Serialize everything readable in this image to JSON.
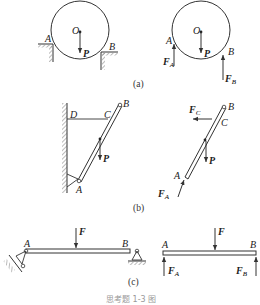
{
  "figure": {
    "caption": "思考题 1-3 图",
    "panels": [
      {
        "id": "a",
        "label": "(a)",
        "left": {
          "center": "O",
          "points": [
            "A",
            "B"
          ],
          "load": "P"
        },
        "right": {
          "center": "O",
          "points": [
            "A",
            "B"
          ],
          "load": "P",
          "reactions": [
            "F",
            "F"
          ],
          "reaction_subs": [
            "A",
            "B"
          ]
        }
      },
      {
        "id": "b",
        "label": "(b)",
        "left": {
          "points": [
            "D",
            "C",
            "B",
            "A"
          ],
          "load": "P"
        },
        "right": {
          "points": [
            "B",
            "C",
            "A"
          ],
          "load": "P",
          "reactions": [
            "F",
            "F"
          ],
          "reaction_subs": [
            "C",
            "A"
          ]
        }
      },
      {
        "id": "c",
        "label": "(c)",
        "left": {
          "points": [
            "A",
            "B"
          ],
          "load": "F"
        },
        "right": {
          "points": [
            "A",
            "B"
          ],
          "load": "F",
          "reactions": [
            "F",
            "F"
          ],
          "reaction_subs": [
            "A",
            "B"
          ]
        }
      }
    ]
  }
}
